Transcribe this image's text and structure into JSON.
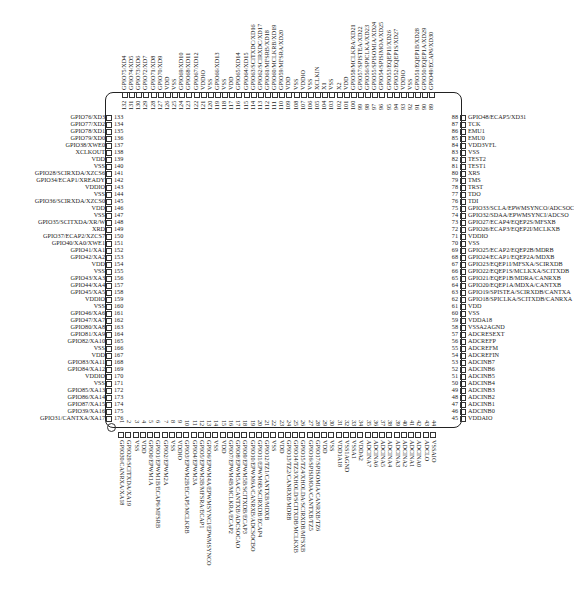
{
  "diagram": {
    "type": "IC pinout (176-pin LQFP)",
    "left_pins": [
      {
        "n": 133,
        "label": "GPIO76/XD3"
      },
      {
        "n": 134,
        "label": "GPIO77/XD2"
      },
      {
        "n": 135,
        "label": "GPIO78/XD1"
      },
      {
        "n": 136,
        "label": "GPIO79/XD0"
      },
      {
        "n": 137,
        "label": "GPIO38/XWE0"
      },
      {
        "n": 138,
        "label": "XCLKOUT"
      },
      {
        "n": 139,
        "label": "VDD"
      },
      {
        "n": 140,
        "label": "VSS"
      },
      {
        "n": 141,
        "label": "GPIO28/SCIRXDA/XZCS6"
      },
      {
        "n": 142,
        "label": "GPIO34/ECAP1/XREADY"
      },
      {
        "n": 143,
        "label": "VDDIO"
      },
      {
        "n": 144,
        "label": "VSS"
      },
      {
        "n": 145,
        "label": "GPIO36/SCIRXDA/XZCS0"
      },
      {
        "n": 146,
        "label": "VDD"
      },
      {
        "n": 147,
        "label": "VSS"
      },
      {
        "n": 148,
        "label": "GPIO35/SCITXDA/XR/W"
      },
      {
        "n": 149,
        "label": "XRD"
      },
      {
        "n": 150,
        "label": "GPIO37/ECAP2/XZCS7"
      },
      {
        "n": 151,
        "label": "GPIO40/XA0/XWE1"
      },
      {
        "n": 152,
        "label": "GPIO41/XA1"
      },
      {
        "n": 153,
        "label": "GPIO42/XA2"
      },
      {
        "n": 154,
        "label": "VDD"
      },
      {
        "n": 155,
        "label": "VSS"
      },
      {
        "n": 156,
        "label": "GPIO43/XA3"
      },
      {
        "n": 157,
        "label": "GPIO44/XA4"
      },
      {
        "n": 158,
        "label": "GPIO45/XA5"
      },
      {
        "n": 159,
        "label": "VDDIO"
      },
      {
        "n": 160,
        "label": "VSS"
      },
      {
        "n": 161,
        "label": "GPIO46/XA6"
      },
      {
        "n": 162,
        "label": "GPIO47/XA7"
      },
      {
        "n": 163,
        "label": "GPIO80/XA8"
      },
      {
        "n": 164,
        "label": "GPIO81/XA9"
      },
      {
        "n": 165,
        "label": "GPIO82/XA10"
      },
      {
        "n": 166,
        "label": "VSS"
      },
      {
        "n": 167,
        "label": "VDD"
      },
      {
        "n": 168,
        "label": "GPIO83/XA11"
      },
      {
        "n": 169,
        "label": "GPIO84/XA12"
      },
      {
        "n": 170,
        "label": "VDDIO"
      },
      {
        "n": 171,
        "label": "VSS"
      },
      {
        "n": 172,
        "label": "GPIO85/XA13"
      },
      {
        "n": 173,
        "label": "GPIO86/XA14"
      },
      {
        "n": 174,
        "label": "GPIO87/XA15"
      },
      {
        "n": 175,
        "label": "GPIO39/XA16"
      },
      {
        "n": 176,
        "label": "GPIO31/CANTXA/XA17"
      }
    ],
    "right_pins": [
      {
        "n": 88,
        "label": "GPIO48/ECAP5/XD31"
      },
      {
        "n": 87,
        "label": "TCK"
      },
      {
        "n": 86,
        "label": "EMU1"
      },
      {
        "n": 85,
        "label": "EMU0"
      },
      {
        "n": 84,
        "label": "VDD3VFL"
      },
      {
        "n": 83,
        "label": "VSS"
      },
      {
        "n": 82,
        "label": "TEST2"
      },
      {
        "n": 81,
        "label": "TEST1"
      },
      {
        "n": 80,
        "label": "XRS"
      },
      {
        "n": 79,
        "label": "TMS"
      },
      {
        "n": 78,
        "label": "TRST"
      },
      {
        "n": 77,
        "label": "TDO"
      },
      {
        "n": 76,
        "label": "TDI"
      },
      {
        "n": 75,
        "label": "GPIO33/SCLA/EPWMSYNCO/ADCSOC"
      },
      {
        "n": 74,
        "label": "GPIO32/SDAA/EPWMSYNCI/ADCSO"
      },
      {
        "n": 73,
        "label": "GPIO27/ECAP4/EQEP2S/MFSXB"
      },
      {
        "n": 72,
        "label": "GPIO26/ECAP3/EQEP2I/MCLKXB"
      },
      {
        "n": 71,
        "label": "VDDIO"
      },
      {
        "n": 70,
        "label": "VSS"
      },
      {
        "n": 69,
        "label": "GPIO25/ECAP2/EQEP2B/MDRB"
      },
      {
        "n": 68,
        "label": "GPIO24/ECAP1/EQEP2A/MDXB"
      },
      {
        "n": 67,
        "label": "GPIO23/EQEP1I/MFSXA/SCIRXDB"
      },
      {
        "n": 66,
        "label": "GPIO22/EQEP1S/MCLKXA/SCITXDB"
      },
      {
        "n": 65,
        "label": "GPIO21/EQEP1B/MDRA/CANRXB"
      },
      {
        "n": 64,
        "label": "GPIO20/EQEP1A/MDXA/CANTXB"
      },
      {
        "n": 63,
        "label": "GPIO19/SPISTEA/SCIRXDB/CANTXA"
      },
      {
        "n": 62,
        "label": "GPIO18/SPICLKA/SCITXDB/CANRXA"
      },
      {
        "n": 61,
        "label": "VDD"
      },
      {
        "n": 60,
        "label": "VSS"
      },
      {
        "n": 59,
        "label": "VDDA18"
      },
      {
        "n": 58,
        "label": "VSSA2AGND"
      },
      {
        "n": 57,
        "label": "ADCRESEXT"
      },
      {
        "n": 56,
        "label": "ADCREFP"
      },
      {
        "n": 55,
        "label": "ADCREFM"
      },
      {
        "n": 54,
        "label": "ADCREFIN"
      },
      {
        "n": 53,
        "label": "ADCINB7"
      },
      {
        "n": 52,
        "label": "ADCINB6"
      },
      {
        "n": 51,
        "label": "ADCINB5"
      },
      {
        "n": 50,
        "label": "ADCINB4"
      },
      {
        "n": 49,
        "label": "ADCINB3"
      },
      {
        "n": 48,
        "label": "ADCINB2"
      },
      {
        "n": 47,
        "label": "ADCINB1"
      },
      {
        "n": 46,
        "label": "ADCINB0"
      },
      {
        "n": 45,
        "label": "VDDAIO"
      }
    ],
    "top_pins": [
      {
        "n": 132,
        "label": "GPIO75/XD4"
      },
      {
        "n": 131,
        "label": "GPIO74/XD5"
      },
      {
        "n": 130,
        "label": "GPIO73/XD6"
      },
      {
        "n": 129,
        "label": "GPIO72/XD7"
      },
      {
        "n": 128,
        "label": "GPIO71/XD8"
      },
      {
        "n": 127,
        "label": "GPIO70/XD9"
      },
      {
        "n": 126,
        "label": "VDD"
      },
      {
        "n": 125,
        "label": "VSS"
      },
      {
        "n": 124,
        "label": "GPIO69/XD10"
      },
      {
        "n": 123,
        "label": "GPIO68/XD11"
      },
      {
        "n": 122,
        "label": "GPIO67/XD12"
      },
      {
        "n": 121,
        "label": "VDDIO"
      },
      {
        "n": 120,
        "label": "VSS"
      },
      {
        "n": 119,
        "label": "GPIO66/XD13"
      },
      {
        "n": 118,
        "label": "VSS"
      },
      {
        "n": 117,
        "label": "VDD"
      },
      {
        "n": 116,
        "label": "GPIO65/XD14"
      },
      {
        "n": 115,
        "label": "GPIO64/XD15"
      },
      {
        "n": 114,
        "label": "GPIO63/SCITXDC/XD16"
      },
      {
        "n": 113,
        "label": "GPIO62/SCIRXDC/XD17"
      },
      {
        "n": 112,
        "label": "GPIO61/MFSRB/XD18"
      },
      {
        "n": 111,
        "label": "GPIO60/MCLKRB/XD19"
      },
      {
        "n": 110,
        "label": "GPIO59/MFSRA/XD20"
      },
      {
        "n": 109,
        "label": "VDD"
      },
      {
        "n": 108,
        "label": "VSS"
      },
      {
        "n": 107,
        "label": "VDDIO"
      },
      {
        "n": 106,
        "label": "VSS"
      },
      {
        "n": 105,
        "label": "XCLKIN"
      },
      {
        "n": 104,
        "label": "X1"
      },
      {
        "n": 103,
        "label": "VSS"
      },
      {
        "n": 102,
        "label": "X2"
      },
      {
        "n": 101,
        "label": "VDD"
      },
      {
        "n": 100,
        "label": "GPIO58/MCLKRA/XD21"
      },
      {
        "n": 99,
        "label": "GPIO57/SPISTEA/XD22"
      },
      {
        "n": 98,
        "label": "GPIO56/SPICLKA/XD23"
      },
      {
        "n": 97,
        "label": "GPIO55/SPISOMIA/XD24"
      },
      {
        "n": 96,
        "label": "GPIO54/SPISIMOA/XD25"
      },
      {
        "n": 95,
        "label": "GPIO53/EQEP1I/XD26"
      },
      {
        "n": 94,
        "label": "GPIO52/EQEP1S/XD27"
      },
      {
        "n": 93,
        "label": "VDDIO"
      },
      {
        "n": 92,
        "label": "VSS"
      },
      {
        "n": 91,
        "label": "GPIO51/EQEP1B/XD28"
      },
      {
        "n": 90,
        "label": "GPIO50/EQEP1A/XD29"
      },
      {
        "n": 89,
        "label": "GPIO49/ECAP6/XD30"
      }
    ],
    "bottom_pins": [
      {
        "n": 1,
        "label": "GPIO30/CANRXA/XA18"
      },
      {
        "n": 2,
        "label": "GPIO29/SCITXDA/XA19"
      },
      {
        "n": 3,
        "label": "VSS"
      },
      {
        "n": 4,
        "label": "VDD"
      },
      {
        "n": 5,
        "label": "GPIO0/EPWM1A"
      },
      {
        "n": 6,
        "label": "GPIO1/EPWM1B/ECAP6/MFSRB"
      },
      {
        "n": 7,
        "label": "GPIO2/EPWM2A"
      },
      {
        "n": 8,
        "label": "VSS"
      },
      {
        "n": 9,
        "label": "VDDIO"
      },
      {
        "n": 10,
        "label": "GPIO3/EPWM2B/ECAP5/MCLKRB"
      },
      {
        "n": 11,
        "label": "GPIO4/EPWM3A"
      },
      {
        "n": 12,
        "label": "GPIO5/EPWM3B/MFSRA/ECAP1"
      },
      {
        "n": 13,
        "label": "GPIO6/EPWM4A/EPWMSYNCI/EPWMSYNCO"
      },
      {
        "n": 14,
        "label": "VSS"
      },
      {
        "n": 15,
        "label": "VDD"
      },
      {
        "n": 16,
        "label": "GPIO7/EPWM4B/MCLKRA/ECAP2"
      },
      {
        "n": 17,
        "label": "GPIO8/EPWM5A/CANTXB/ADCSOCAO"
      },
      {
        "n": 18,
        "label": "GPIO9/EPWM5B/SCITXDB/ECAP3"
      },
      {
        "n": 19,
        "label": "GPIO10/EPWM6A/CANRXB/ADCSOCBO"
      },
      {
        "n": 20,
        "label": "GPIO11/EPWM6B/SCIRXDB/ECAP4"
      },
      {
        "n": 21,
        "label": "GPIO12/TZ1/CANTXB/MDXB"
      },
      {
        "n": 22,
        "label": "VSS"
      },
      {
        "n": 23,
        "label": "VDD"
      },
      {
        "n": 24,
        "label": "GPIO13/TZ2/CANRXB/MDRB"
      },
      {
        "n": 25,
        "label": "GPIO14/TZ3/XHOLD/SCITXDB/MCLKXB"
      },
      {
        "n": 26,
        "label": "GPIO15/TZ4/XHOLDA/SCIRXDB/MFSXB"
      },
      {
        "n": 27,
        "label": "GPIO16/SPISIMOA/CANTXB/TZ5"
      },
      {
        "n": 28,
        "label": "GPIO17/SPISOMIA/CANRXB/TZ6"
      },
      {
        "n": 29,
        "label": "VDD"
      },
      {
        "n": 30,
        "label": "VSS"
      },
      {
        "n": 31,
        "label": "VDD1A18"
      },
      {
        "n": 32,
        "label": "VSS1AGND"
      },
      {
        "n": 33,
        "label": "VSSA1"
      },
      {
        "n": 34,
        "label": "VDDA2"
      },
      {
        "n": 35,
        "label": "ADCINA7"
      },
      {
        "n": 36,
        "label": "ADCINA6"
      },
      {
        "n": 37,
        "label": "ADCINA5"
      },
      {
        "n": 38,
        "label": "ADCINA4"
      },
      {
        "n": 39,
        "label": "ADCINA3"
      },
      {
        "n": 40,
        "label": "ADCINA2"
      },
      {
        "n": 41,
        "label": "ADCINA1"
      },
      {
        "n": 42,
        "label": "ADCINA0"
      },
      {
        "n": 43,
        "label": "ADCLO"
      },
      {
        "n": 44,
        "label": "VSSAIO"
      }
    ]
  }
}
